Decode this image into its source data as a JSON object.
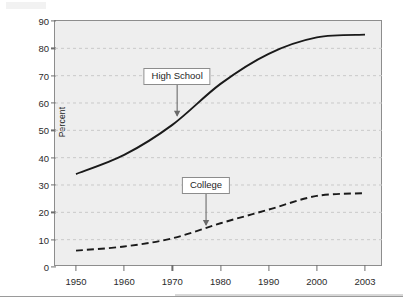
{
  "figure": {
    "background_color": "#ffffff",
    "plot_background_color": "#eeeeee",
    "frame_color": "#8d8d8d",
    "gridline_color": "#c9c9c9"
  },
  "chart_data": {
    "type": "line",
    "title": "",
    "subtitle": "",
    "xlabel": "",
    "ylabel": "Percent",
    "xlim": [
      1950,
      2003
    ],
    "ylim": [
      0,
      90
    ],
    "ytick_step": 10,
    "grid": true,
    "grid_axis": "y",
    "legend": "none (inline callout labels with arrows)",
    "categories": [
      "1950",
      "1960",
      "1970",
      "1980",
      "1990",
      "2000",
      "2003"
    ],
    "x": [
      1950,
      1960,
      1970,
      1980,
      1990,
      2000,
      2003
    ],
    "yticks": [
      0,
      10,
      20,
      30,
      40,
      50,
      60,
      70,
      80,
      90
    ],
    "series": [
      {
        "name": "High School",
        "style": "solid",
        "color": "#1a1a1a",
        "values": [
          34,
          41,
          52,
          67,
          78,
          84,
          85
        ]
      },
      {
        "name": "College",
        "style": "dashed",
        "color": "#1a1a1a",
        "values": [
          6,
          7.5,
          10.5,
          16,
          21,
          26,
          27
        ]
      }
    ],
    "annotations": [
      {
        "label": "High School",
        "points_to_series": "High School",
        "arrow_x_year": 1971,
        "arrow_y_percent": 55
      },
      {
        "label": "College",
        "points_to_series": "College",
        "arrow_x_year": 1977,
        "arrow_y_percent": 15
      }
    ]
  }
}
